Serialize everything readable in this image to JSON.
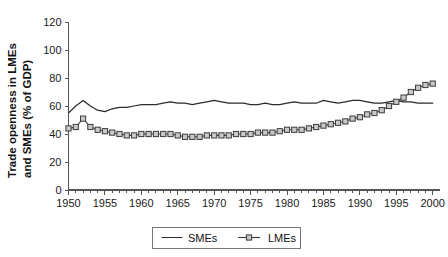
{
  "chart_data": {
    "type": "line",
    "title": "",
    "subtitle": "",
    "xlabel": "",
    "ylabel": "Trade openness in LMEs and SMEs (% of GDP)",
    "ylabel_lines": [
      "Trade openness in LMEs",
      "and SMEs (% of GDP)"
    ],
    "xlim": [
      1950,
      2001
    ],
    "ylim": [
      0,
      120
    ],
    "ytick_step": 20,
    "xtick_major_step": 5,
    "xtick_minor_step": 1,
    "grid": false,
    "legend_position": "bottom-center",
    "ytick_labels": [
      "0",
      "20",
      "40",
      "60",
      "80",
      "100",
      "120"
    ],
    "ytick_values": [
      0,
      20,
      40,
      60,
      80,
      100,
      120
    ],
    "xtick_labels": [
      "1950",
      "1955",
      "1960",
      "1965",
      "1970",
      "1975",
      "1980",
      "1985",
      "1990",
      "1995",
      "2000"
    ],
    "xtick_values": [
      1950,
      1955,
      1960,
      1965,
      1970,
      1975,
      1980,
      1985,
      1990,
      1995,
      2000
    ],
    "x": [
      1950,
      1951,
      1952,
      1953,
      1954,
      1955,
      1956,
      1957,
      1958,
      1959,
      1960,
      1961,
      1962,
      1963,
      1964,
      1965,
      1966,
      1967,
      1968,
      1969,
      1970,
      1971,
      1972,
      1973,
      1974,
      1975,
      1976,
      1977,
      1978,
      1979,
      1980,
      1981,
      1982,
      1983,
      1984,
      1985,
      1986,
      1987,
      1988,
      1989,
      1990,
      1991,
      1992,
      1993,
      1994,
      1995,
      1996,
      1997,
      1998,
      1999,
      2000
    ],
    "series": [
      {
        "name": "SMEs",
        "marker": "none",
        "color": "#2b2b2b",
        "values": [
          55,
          60,
          64,
          60,
          57,
          56,
          58,
          59,
          59,
          60,
          61,
          61,
          61,
          62,
          63,
          62,
          62,
          61,
          62,
          63,
          64,
          63,
          62,
          62,
          62,
          61,
          61,
          62,
          61,
          61,
          62,
          63,
          62,
          62,
          62,
          64,
          63,
          62,
          63,
          64,
          64,
          63,
          62,
          62,
          63,
          64,
          63,
          63,
          62,
          62,
          62
        ]
      },
      {
        "name": "LMEs",
        "marker": "square",
        "color": "#c9c9c9",
        "values": [
          44,
          45,
          51,
          45,
          43,
          42,
          41,
          40,
          39,
          39,
          40,
          40,
          40,
          40,
          40,
          39,
          38,
          38,
          38,
          39,
          39,
          39,
          39,
          40,
          40,
          40,
          41,
          41,
          41,
          42,
          43,
          43,
          43,
          44,
          45,
          46,
          47,
          48,
          49,
          51,
          52,
          54,
          55,
          57,
          60,
          63,
          66,
          70,
          73,
          75,
          76
        ]
      }
    ],
    "legend": [
      {
        "label": "SMEs",
        "marker": "line"
      },
      {
        "label": "LMEs",
        "marker": "line-square"
      }
    ]
  }
}
